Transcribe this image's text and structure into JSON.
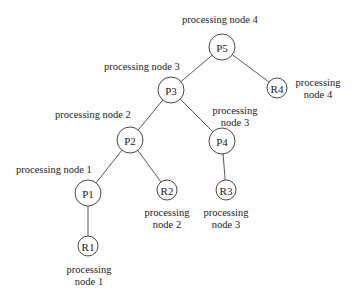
{
  "diagram": {
    "type": "tree",
    "nodes": [
      {
        "id": "P5",
        "label": "P5",
        "cx": 222,
        "cy": 47,
        "r": 13
      },
      {
        "id": "P3",
        "label": "P3",
        "cx": 171,
        "cy": 90,
        "r": 13
      },
      {
        "id": "R4",
        "label": "R4",
        "cx": 277,
        "cy": 88,
        "r": 10
      },
      {
        "id": "P2",
        "label": "P2",
        "cx": 130,
        "cy": 140,
        "r": 13
      },
      {
        "id": "P4",
        "label": "P4",
        "cx": 222,
        "cy": 141,
        "r": 13
      },
      {
        "id": "P1",
        "label": "P1",
        "cx": 88,
        "cy": 193,
        "r": 13
      },
      {
        "id": "R2",
        "label": "R2",
        "cx": 167,
        "cy": 190,
        "r": 10
      },
      {
        "id": "R3",
        "label": "R3",
        "cx": 226,
        "cy": 190,
        "r": 10
      },
      {
        "id": "R1",
        "label": "R1",
        "cx": 88,
        "cy": 246,
        "r": 10
      }
    ],
    "edges": [
      [
        "P5",
        "P3"
      ],
      [
        "P5",
        "R4"
      ],
      [
        "P3",
        "P2"
      ],
      [
        "P3",
        "P4"
      ],
      [
        "P2",
        "P1"
      ],
      [
        "P2",
        "R2"
      ],
      [
        "P4",
        "R3"
      ],
      [
        "P1",
        "R1"
      ]
    ],
    "labels": [
      {
        "for": "P5",
        "lines": [
          "processing node 4"
        ],
        "x": 182,
        "y": 23,
        "anchor": "start"
      },
      {
        "for": "P3",
        "lines": [
          "processing node 3"
        ],
        "x": 104,
        "y": 70,
        "anchor": "start"
      },
      {
        "for": "R4",
        "lines": [
          "processing",
          "node 4"
        ],
        "x": 318,
        "y": 86,
        "anchor": "middle"
      },
      {
        "for": "P2",
        "lines": [
          "processing node 2"
        ],
        "x": 55,
        "y": 118,
        "anchor": "start"
      },
      {
        "for": "P4",
        "lines": [
          "processing",
          "node 3"
        ],
        "x": 235,
        "y": 114,
        "anchor": "middle"
      },
      {
        "for": "P1",
        "lines": [
          "processing node 1"
        ],
        "x": 16,
        "y": 173,
        "anchor": "start"
      },
      {
        "for": "R2",
        "lines": [
          "processing",
          "node 2"
        ],
        "x": 167,
        "y": 216,
        "anchor": "middle"
      },
      {
        "for": "R3",
        "lines": [
          "processing",
          "node 3"
        ],
        "x": 226,
        "y": 216,
        "anchor": "middle"
      },
      {
        "for": "R1",
        "lines": [
          "processing",
          "node 1"
        ],
        "x": 89,
        "y": 273,
        "anchor": "middle"
      }
    ]
  }
}
